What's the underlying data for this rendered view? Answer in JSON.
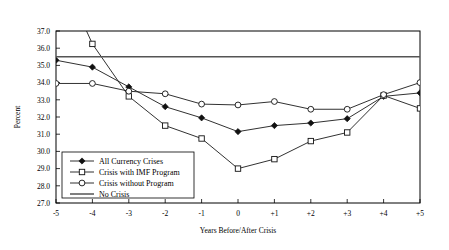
{
  "panel": {
    "label": "F"
  },
  "chart_data": {
    "type": "line",
    "title": "",
    "xlabel": "Years Before/After Crisis",
    "ylabel": "Percent",
    "categories": [
      "-5",
      "-4",
      "-3",
      "-2",
      "-1",
      "0",
      "+1",
      "+2",
      "+3",
      "+4",
      "+5"
    ],
    "x": [
      -5,
      -4,
      -3,
      -2,
      -1,
      0,
      1,
      2,
      3,
      4,
      5
    ],
    "xlim": [
      -5,
      5
    ],
    "ylim": [
      27.0,
      37.0
    ],
    "yticks": [
      "27.0",
      "28.0",
      "29.0",
      "30.0",
      "31.0",
      "32.0",
      "33.0",
      "34.0",
      "35.0",
      "36.0",
      "37.0"
    ],
    "ytick_values": [
      27.0,
      28.0,
      29.0,
      30.0,
      31.0,
      32.0,
      33.0,
      34.0,
      35.0,
      36.0,
      37.0
    ],
    "grid": false,
    "legend_position": "lower-left-inside",
    "series": [
      {
        "name": "All Currency Crises",
        "marker": "filled-diamond",
        "values": [
          35.3,
          34.9,
          33.75,
          32.6,
          31.95,
          31.15,
          31.5,
          31.65,
          31.9,
          33.2,
          33.4
        ]
      },
      {
        "name": "Crisis with IMF Program",
        "marker": "open-square",
        "values": [
          null,
          36.25,
          33.2,
          31.5,
          30.75,
          29.0,
          29.55,
          30.6,
          31.1,
          33.25,
          32.5
        ]
      },
      {
        "name": "Crisis without Program",
        "marker": "open-circle",
        "values": [
          33.95,
          33.95,
          33.5,
          33.35,
          32.75,
          32.7,
          32.9,
          32.45,
          32.45,
          33.3,
          34.0
        ]
      },
      {
        "name": "No Crisis",
        "marker": "none",
        "values": [
          35.5,
          35.5,
          35.5,
          35.5,
          35.5,
          35.5,
          35.5,
          35.5,
          35.5,
          35.5,
          35.5
        ]
      }
    ],
    "colors": {
      "line": "#1a1a1a",
      "no_crisis_line": "#555555",
      "axis": "#000000",
      "background": "#ffffff"
    }
  },
  "legend": {
    "items": [
      {
        "label": "All Currency Crises",
        "marker": "filled-diamond"
      },
      {
        "label": "Crisis with IMF Program",
        "marker": "open-square"
      },
      {
        "label": "Crisis without Program",
        "marker": "open-circle"
      },
      {
        "label": "No Crisis",
        "marker": "none"
      }
    ]
  }
}
